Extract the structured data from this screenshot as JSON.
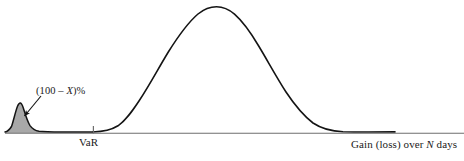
{
  "figure": {
    "kind": "probability-distribution-diagram",
    "background_color": "#ffffff",
    "curve_color": "#141414",
    "axis_color": "#6e6e6e",
    "tail_fill_color": "#a8a8a8",
    "tail_outline_color": "#141414",
    "arrow_color": "#141414"
  },
  "labels": {
    "var_threshold": "VaR",
    "x_axis_prefix": "Gain (loss) over ",
    "x_axis_variable": "N",
    "x_axis_suffix": " days",
    "tail_annotation_prefix": "(100 – ",
    "tail_annotation_variable": "X",
    "tail_annotation_suffix": ")%"
  },
  "chart_data": {
    "type": "line",
    "title": "",
    "xlabel": "Gain (loss) over N days",
    "ylabel": "",
    "grid": false,
    "legend": null,
    "xlim": [
      0,
      464
    ],
    "ylim": [
      0,
      161
    ],
    "annotations": [
      {
        "name": "tail-probability",
        "text": "(100 – X)%",
        "text_x": 36,
        "text_y": 92,
        "arrow_from_x": 41,
        "arrow_from_y": 96,
        "arrow_to_x": 23,
        "arrow_to_y": 117,
        "describes": "probability mass in the shaded left loss tail beyond VaR"
      },
      {
        "name": "var-threshold-tick",
        "text": "VaR",
        "x": 93,
        "y": 131,
        "tick_top": 126,
        "tick_bottom": 133
      }
    ],
    "baseline": {
      "y": 132,
      "x_start": 5,
      "x_end": 464
    },
    "series": [
      {
        "name": "loss-tail",
        "shaded": true,
        "fill": "#a8a8a8",
        "x_start": 5,
        "x_end": 93,
        "peak_x": 20,
        "peak_y": 103,
        "points": [
          [
            5,
            132
          ],
          [
            8,
            131
          ],
          [
            11,
            127
          ],
          [
            14,
            118
          ],
          [
            17,
            108
          ],
          [
            20,
            103
          ],
          [
            23,
            105
          ],
          [
            26,
            112
          ],
          [
            30,
            121
          ],
          [
            34,
            127
          ],
          [
            38,
            130
          ],
          [
            44,
            131
          ],
          [
            52,
            132
          ],
          [
            70,
            132
          ],
          [
            93,
            132
          ]
        ]
      },
      {
        "name": "main-distribution",
        "shaded": false,
        "stroke": "#141414",
        "x_start": 93,
        "x_end": 400,
        "peak_x": 216,
        "peak_y": 8,
        "points": [
          [
            93,
            132
          ],
          [
            105,
            131
          ],
          [
            115,
            128
          ],
          [
            125,
            120
          ],
          [
            138,
            105
          ],
          [
            152,
            85
          ],
          [
            166,
            63
          ],
          [
            180,
            43
          ],
          [
            194,
            25
          ],
          [
            206,
            13
          ],
          [
            216,
            8
          ],
          [
            228,
            8
          ],
          [
            240,
            13
          ],
          [
            254,
            25
          ],
          [
            268,
            42
          ],
          [
            282,
            60
          ],
          [
            296,
            79
          ],
          [
            310,
            96
          ],
          [
            324,
            110
          ],
          [
            338,
            120
          ],
          [
            352,
            127
          ],
          [
            366,
            130
          ],
          [
            380,
            131
          ],
          [
            395,
            131
          ]
        ]
      }
    ]
  }
}
